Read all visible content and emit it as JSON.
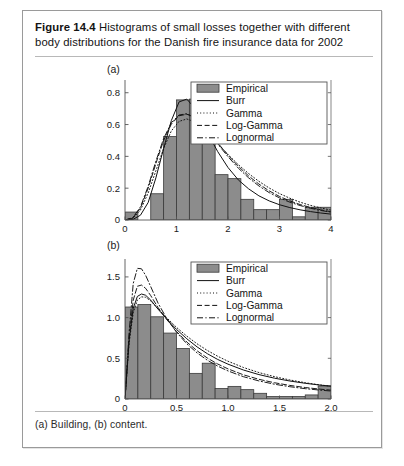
{
  "figure": {
    "number_label": "Figure 14.4",
    "title": "Histograms of small losses together with different body distributions for the Danish fire insurance data for 2002",
    "footnote": "(a) Building, (b) content."
  },
  "panel_a": {
    "label": "(a)"
  },
  "panel_b": {
    "label": "(b)"
  },
  "colors": {
    "bar_fill": "#8c8c8c",
    "bar_edge": "#3a3a3a",
    "curve": "#111111",
    "axis": "#555555",
    "frame": "#9a9a9a",
    "text": "#141414"
  },
  "legend": {
    "entries": [
      {
        "label": "Empirical",
        "style": "patch"
      },
      {
        "label": "Burr",
        "style": "solid"
      },
      {
        "label": "Gamma",
        "style": "dotted"
      },
      {
        "label": "Log-Gamma",
        "style": "dashed"
      },
      {
        "label": "Lognormal",
        "style": "dashdot"
      }
    ]
  },
  "chart_data": [
    {
      "type": "bar",
      "id": "panel-a",
      "title": "(a) Building",
      "xlabel": "",
      "ylabel": "",
      "xlim": [
        0,
        4
      ],
      "ylim": [
        0,
        0.88
      ],
      "grid": false,
      "legend_position": "upper-right",
      "xticks": [
        0,
        1,
        2,
        3,
        4
      ],
      "xticklabels": [
        "0",
        "1",
        "2",
        "3",
        "4"
      ],
      "yticks": [
        0,
        0.2,
        0.4,
        0.6,
        0.8
      ],
      "yticklabels": [
        "0",
        "0.2",
        "0.4",
        "0.6",
        "0.8"
      ],
      "bin_width": 0.25,
      "bin_edges": [
        0,
        0.25,
        0.5,
        0.75,
        1.0,
        1.25,
        1.5,
        1.75,
        2.0,
        2.25,
        2.5,
        2.75,
        3.0,
        3.25,
        3.5,
        3.75,
        4.0
      ],
      "values": [
        0.05,
        0.0,
        0.165,
        0.525,
        0.755,
        0.76,
        0.6,
        0.285,
        0.26,
        0.13,
        0.065,
        0.065,
        0.13,
        0.02,
        0.08,
        0.08
      ],
      "series": [
        {
          "name": "Empirical",
          "style": "patch",
          "values": [
            0.05,
            0.0,
            0.165,
            0.525,
            0.755,
            0.76,
            0.6,
            0.285,
            0.26,
            0.13,
            0.065,
            0.065,
            0.13,
            0.02,
            0.08,
            0.08
          ]
        },
        {
          "name": "Burr",
          "style": "solid",
          "x": [
            0.0,
            0.15,
            0.3,
            0.45,
            0.6,
            0.75,
            0.9,
            1.05,
            1.2,
            1.35,
            1.5,
            1.65,
            1.8,
            2.0,
            2.2,
            2.4,
            2.6,
            2.8,
            3.0,
            3.2,
            3.4,
            3.6,
            3.8,
            4.0
          ],
          "y": [
            0.0,
            0.003,
            0.03,
            0.11,
            0.265,
            0.45,
            0.625,
            0.742,
            0.76,
            0.705,
            0.615,
            0.52,
            0.43,
            0.33,
            0.252,
            0.196,
            0.152,
            0.12,
            0.096,
            0.078,
            0.064,
            0.053,
            0.044,
            0.037
          ]
        },
        {
          "name": "Gamma",
          "style": "dotted",
          "x": [
            0.0,
            0.15,
            0.3,
            0.45,
            0.6,
            0.75,
            0.9,
            1.05,
            1.2,
            1.35,
            1.5,
            1.65,
            1.8,
            2.0,
            2.2,
            2.4,
            2.6,
            2.8,
            3.0,
            3.2,
            3.4,
            3.6,
            3.8,
            4.0
          ],
          "y": [
            0.0,
            0.01,
            0.062,
            0.17,
            0.31,
            0.45,
            0.56,
            0.62,
            0.635,
            0.618,
            0.58,
            0.532,
            0.48,
            0.412,
            0.348,
            0.292,
            0.243,
            0.201,
            0.166,
            0.137,
            0.112,
            0.092,
            0.076,
            0.062
          ]
        },
        {
          "name": "Log-Gamma",
          "style": "dashed",
          "x": [
            0.0,
            0.15,
            0.3,
            0.45,
            0.6,
            0.75,
            0.9,
            1.05,
            1.2,
            1.35,
            1.5,
            1.65,
            1.8,
            2.0,
            2.2,
            2.4,
            2.6,
            2.8,
            3.0,
            3.2,
            3.4,
            3.6,
            3.8,
            4.0
          ],
          "y": [
            0.0,
            0.012,
            0.075,
            0.2,
            0.355,
            0.5,
            0.603,
            0.655,
            0.665,
            0.645,
            0.6,
            0.545,
            0.485,
            0.408,
            0.338,
            0.277,
            0.226,
            0.183,
            0.148,
            0.12,
            0.097,
            0.079,
            0.064,
            0.052
          ]
        },
        {
          "name": "Lognormal",
          "style": "dashdot",
          "x": [
            0.0,
            0.15,
            0.3,
            0.45,
            0.6,
            0.75,
            0.9,
            1.05,
            1.2,
            1.35,
            1.5,
            1.65,
            1.8,
            2.0,
            2.2,
            2.4,
            2.6,
            2.8,
            3.0,
            3.2,
            3.4,
            3.6,
            3.8,
            4.0
          ],
          "y": [
            0.0,
            0.014,
            0.082,
            0.212,
            0.37,
            0.512,
            0.612,
            0.66,
            0.668,
            0.645,
            0.598,
            0.54,
            0.478,
            0.398,
            0.326,
            0.265,
            0.214,
            0.172,
            0.139,
            0.112,
            0.091,
            0.074,
            0.06,
            0.049
          ]
        }
      ]
    },
    {
      "type": "bar",
      "id": "panel-b",
      "title": "(b) content",
      "xlabel": "",
      "ylabel": "",
      "xlim": [
        0,
        2
      ],
      "ylim": [
        0,
        1.72
      ],
      "grid": false,
      "legend_position": "upper-right",
      "xticks": [
        0,
        0.5,
        1.0,
        1.5,
        2.0
      ],
      "xticklabels": [
        "0",
        "0.5",
        "1.0",
        "1.5",
        "2.0"
      ],
      "yticks": [
        0,
        0.5,
        1.0,
        1.5
      ],
      "yticklabels": [
        "0",
        "0.5",
        "1.0",
        "1.5"
      ],
      "bin_width": 0.125,
      "bin_edges": [
        0,
        0.125,
        0.25,
        0.375,
        0.5,
        0.625,
        0.75,
        0.875,
        1.0,
        1.125,
        1.25,
        1.375,
        1.5,
        1.625,
        1.75,
        1.875,
        2.0
      ],
      "values": [
        1.13,
        1.16,
        1.01,
        0.81,
        0.62,
        0.315,
        0.44,
        0.13,
        0.155,
        0.115,
        0.07,
        0.03,
        0.03,
        0.03,
        0.05,
        0.16
      ],
      "series": [
        {
          "name": "Empirical",
          "style": "patch",
          "values": [
            1.13,
            1.16,
            1.01,
            0.81,
            0.62,
            0.315,
            0.44,
            0.13,
            0.155,
            0.115,
            0.07,
            0.03,
            0.03,
            0.03,
            0.05,
            0.16
          ]
        },
        {
          "name": "Burr",
          "style": "solid",
          "x": [
            0.0,
            0.04,
            0.08,
            0.12,
            0.16,
            0.2,
            0.25,
            0.32,
            0.4,
            0.5,
            0.6,
            0.7,
            0.8,
            0.9,
            1.0,
            1.15,
            1.3,
            1.45,
            1.6,
            1.75,
            1.9,
            2.0
          ],
          "y": [
            0.0,
            0.72,
            1.115,
            1.26,
            1.29,
            1.275,
            1.215,
            1.105,
            0.99,
            0.855,
            0.74,
            0.64,
            0.556,
            0.486,
            0.428,
            0.356,
            0.3,
            0.256,
            0.221,
            0.193,
            0.17,
            0.158
          ]
        },
        {
          "name": "Gamma",
          "style": "dotted",
          "x": [
            0.0,
            0.04,
            0.08,
            0.12,
            0.16,
            0.2,
            0.25,
            0.32,
            0.4,
            0.5,
            0.6,
            0.7,
            0.8,
            0.9,
            1.0,
            1.15,
            1.3,
            1.45,
            1.6,
            1.75,
            1.9,
            2.0
          ],
          "y": [
            0.0,
            0.69,
            1.06,
            1.215,
            1.255,
            1.25,
            1.205,
            1.11,
            1.005,
            0.88,
            0.772,
            0.678,
            0.596,
            0.525,
            0.464,
            0.387,
            0.325,
            0.275,
            0.234,
            0.2,
            0.172,
            0.157
          ]
        },
        {
          "name": "Log-Gamma",
          "style": "dashed",
          "x": [
            0.0,
            0.04,
            0.08,
            0.12,
            0.16,
            0.2,
            0.25,
            0.32,
            0.4,
            0.5,
            0.6,
            0.7,
            0.8,
            0.9,
            1.0,
            1.15,
            1.3,
            1.45,
            1.6,
            1.75,
            1.9,
            2.0
          ],
          "y": [
            0.0,
            0.76,
            1.215,
            1.385,
            1.4,
            1.36,
            1.27,
            1.125,
            0.985,
            0.83,
            0.7,
            0.592,
            0.503,
            0.43,
            0.37,
            0.297,
            0.242,
            0.2,
            0.167,
            0.141,
            0.12,
            0.109
          ]
        },
        {
          "name": "Lognormal",
          "style": "dashdot",
          "x": [
            0.0,
            0.04,
            0.08,
            0.12,
            0.16,
            0.2,
            0.25,
            0.32,
            0.4,
            0.5,
            0.6,
            0.7,
            0.8,
            0.9,
            1.0,
            1.15,
            1.3,
            1.45,
            1.6,
            1.75,
            1.9,
            2.0
          ],
          "y": [
            0.0,
            0.82,
            1.42,
            1.605,
            1.6,
            1.52,
            1.38,
            1.18,
            1.0,
            0.82,
            0.678,
            0.566,
            0.476,
            0.404,
            0.345,
            0.274,
            0.222,
            0.182,
            0.151,
            0.127,
            0.108,
            0.098
          ]
        }
      ]
    }
  ]
}
